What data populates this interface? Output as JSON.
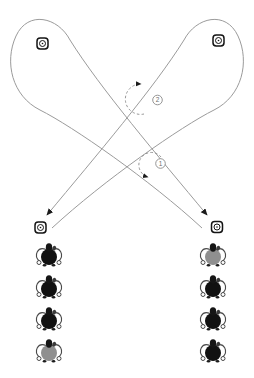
{
  "step_labels": {
    "first": "1",
    "second": "2"
  },
  "colors": {
    "path_line": "#9b9b9b",
    "dashed_annotation": "#8a8a8a",
    "marker_outline": "#141414",
    "dancer_black": "#111111",
    "dancer_gray": "#8f8f8f"
  },
  "dancers": {
    "left_column_colors": [
      "#111111",
      "#111111",
      "#111111",
      "#8f8f8f"
    ],
    "right_column_colors": [
      "#8f8f8f",
      "#111111",
      "#111111",
      "#111111"
    ]
  }
}
